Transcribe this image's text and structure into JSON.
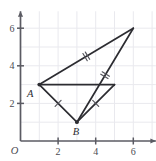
{
  "figure": {
    "name": "coordinate-plane-congruent-triangles",
    "origin_label": "O",
    "x_axis": {
      "label": "",
      "ticks": [
        {
          "value": 2,
          "label": "2"
        },
        {
          "value": 4,
          "label": "4"
        },
        {
          "value": 6,
          "label": "6"
        }
      ],
      "range": [
        0,
        7.2
      ]
    },
    "y_axis": {
      "label": "",
      "ticks": [
        {
          "value": 2,
          "label": "2"
        },
        {
          "value": 4,
          "label": "4"
        },
        {
          "value": 6,
          "label": "6"
        }
      ],
      "range": [
        0,
        6.9
      ]
    },
    "grid": true,
    "grid_step": 1,
    "points": [
      {
        "id": "A",
        "label": "A",
        "x": 1,
        "y": 3,
        "label_dx": -9,
        "label_dy": 12
      },
      {
        "id": "B",
        "label": "B",
        "x": 3,
        "y": 1,
        "label_dx": -1,
        "label_dy": 13
      },
      {
        "id": "C",
        "label": "",
        "x": 6,
        "y": 6,
        "label_dx": 0,
        "label_dy": 0
      },
      {
        "id": "D",
        "label": "",
        "x": 5,
        "y": 3,
        "label_dx": 0,
        "label_dy": 0
      }
    ],
    "segments": [
      {
        "id": "A-C",
        "from": "A",
        "to": "C",
        "hatches": 2
      },
      {
        "id": "B-C",
        "from": "B",
        "to": "C",
        "hatches": 2
      },
      {
        "id": "A-B",
        "from": "A",
        "to": "B",
        "hatches": 1
      },
      {
        "id": "B-D",
        "from": "B",
        "to": "D",
        "hatches": 1
      },
      {
        "id": "A-D",
        "from": "A",
        "to": "D",
        "hatches": 0
      }
    ],
    "colors": {
      "grid": "#e9e9ee",
      "axis": "#5b5b63",
      "segment": "#2c2c31",
      "hatch": "#55555c",
      "label": "#4a4a52",
      "background": "#ffffff"
    }
  }
}
